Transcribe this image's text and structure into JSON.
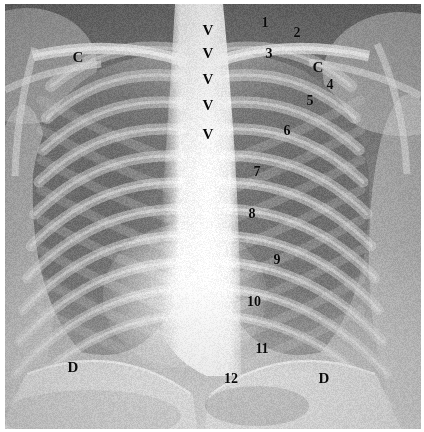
{
  "figure": {
    "name": "annotated-chest-radiograph",
    "modality": "chest x-ray",
    "view": "posteroanterior",
    "border_color": "#ffffff",
    "label_color": "#0a0a0a"
  },
  "annotations": {
    "clavicles": [
      {
        "text": "C",
        "x": 78,
        "y": 57,
        "size": "letter",
        "meaning": "clavicle-left-side-of-image"
      },
      {
        "text": "C",
        "x": 318,
        "y": 67,
        "size": "letter",
        "meaning": "clavicle-right-side-of-image"
      }
    ],
    "diaphragms": [
      {
        "text": "D",
        "x": 73,
        "y": 367,
        "size": "letter",
        "meaning": "diaphragm-left-side-of-image"
      },
      {
        "text": "D",
        "x": 324,
        "y": 378,
        "size": "letter",
        "meaning": "diaphragm-right-side-of-image"
      }
    ],
    "vertebrae": [
      {
        "text": "V",
        "x": 208,
        "y": 30,
        "size": "vert",
        "meaning": "vertebral-body-1"
      },
      {
        "text": "V",
        "x": 208,
        "y": 53,
        "size": "vert",
        "meaning": "vertebral-body-2"
      },
      {
        "text": "V",
        "x": 208,
        "y": 79,
        "size": "vert",
        "meaning": "vertebral-body-3"
      },
      {
        "text": "V",
        "x": 208,
        "y": 105,
        "size": "vert",
        "meaning": "vertebral-body-4"
      },
      {
        "text": "V",
        "x": 208,
        "y": 134,
        "size": "vert",
        "meaning": "vertebral-body-5"
      }
    ],
    "ribs": [
      {
        "text": "1",
        "x": 265,
        "y": 23,
        "size": "num",
        "meaning": "rib-1"
      },
      {
        "text": "2",
        "x": 297,
        "y": 33,
        "size": "num",
        "meaning": "rib-2"
      },
      {
        "text": "3",
        "x": 269,
        "y": 54,
        "size": "num",
        "meaning": "rib-3"
      },
      {
        "text": "4",
        "x": 330,
        "y": 85,
        "size": "num",
        "meaning": "rib-4"
      },
      {
        "text": "5",
        "x": 310,
        "y": 101,
        "size": "num",
        "meaning": "rib-5"
      },
      {
        "text": "6",
        "x": 287,
        "y": 131,
        "size": "num",
        "meaning": "rib-6"
      },
      {
        "text": "7",
        "x": 257,
        "y": 172,
        "size": "num",
        "meaning": "rib-7"
      },
      {
        "text": "8",
        "x": 252,
        "y": 214,
        "size": "num",
        "meaning": "rib-8"
      },
      {
        "text": "9",
        "x": 277,
        "y": 260,
        "size": "num",
        "meaning": "rib-9"
      },
      {
        "text": "10",
        "x": 254,
        "y": 302,
        "size": "num2",
        "meaning": "rib-10"
      },
      {
        "text": "11",
        "x": 262,
        "y": 349,
        "size": "num2",
        "meaning": "rib-11"
      },
      {
        "text": "12",
        "x": 231,
        "y": 379,
        "size": "num2",
        "meaning": "rib-12"
      }
    ]
  },
  "render": {
    "width": 416,
    "height": 425,
    "tones": {
      "background_upper": "#6d6d6d",
      "soft_tissue": "#9a9a9a",
      "lung_field": "#7d7d7d",
      "rib_band": "#c2c2c2",
      "mediastinum": "#fbfbfb",
      "sub_diaphragm": "#e2e2e2",
      "bone_bright": "#f2f2f2"
    }
  }
}
